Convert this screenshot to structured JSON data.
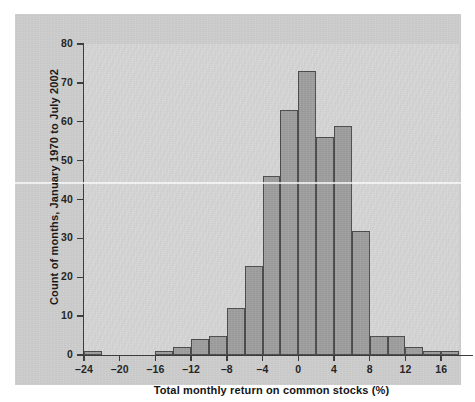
{
  "chart_data": {
    "type": "bar",
    "title": "",
    "xlabel": "Total monthly return on common stocks (%)",
    "ylabel": "Count of months, January 1970 to July 2002",
    "xlim": [
      -24,
      18
    ],
    "ylim": [
      0,
      80
    ],
    "bin_width": 2,
    "grid": false,
    "legend": null,
    "x_tick_labels": [
      "–24",
      "–20",
      "–16",
      "–12",
      "–8",
      "–4",
      "0",
      "4",
      "8",
      "12",
      "16"
    ],
    "x_tick_values": [
      -24,
      -20,
      -16,
      -12,
      -8,
      -4,
      0,
      4,
      8,
      12,
      16
    ],
    "y_tick_labels": [
      "0",
      "10",
      "20",
      "30",
      "40",
      "50",
      "60",
      "70",
      "80"
    ],
    "y_tick_values": [
      0,
      10,
      20,
      30,
      40,
      50,
      60,
      70,
      80
    ],
    "bin_starts": [
      -24,
      -22,
      -20,
      -18,
      -16,
      -14,
      -12,
      -10,
      -8,
      -6,
      -4,
      -2,
      0,
      2,
      4,
      6,
      8,
      10,
      12,
      14,
      16
    ],
    "bin_labels": [
      "−24 to −22",
      "−22 to −20",
      "−20 to −18",
      "−18 to −16",
      "−16 to −14",
      "−14 to −12",
      "−12 to −10",
      "−10 to −8",
      "−8 to −6",
      "−6 to −4",
      "−4 to −2",
      "−2 to 0",
      "0 to 2",
      "2 to 4",
      "4 to 6",
      "6 to 8",
      "8 to 10",
      "10 to 12",
      "12 to 14",
      "14 to 16",
      "16 to 18"
    ],
    "values": [
      1,
      0,
      0,
      0,
      1,
      2,
      4,
      5,
      12,
      23,
      46,
      63,
      73,
      56,
      59,
      32,
      5,
      5,
      2,
      1,
      1
    ]
  },
  "colors": {
    "figure_background": "#cccccc",
    "plot_background": "#d5d5d5",
    "bar_fill": "#9d9d9d",
    "bar_edge": "#4a4a4a",
    "axis": "#3a3a3a",
    "text": "#141414",
    "page": "#ffffff"
  }
}
